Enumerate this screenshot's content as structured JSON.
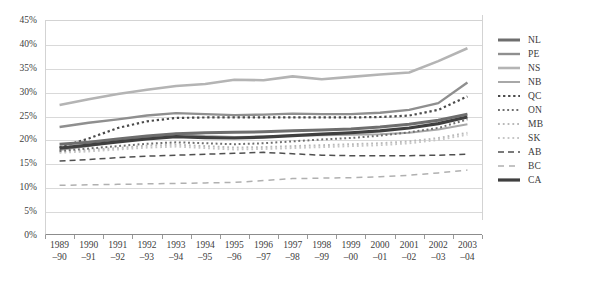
{
  "chart_data": {
    "type": "line",
    "title": "",
    "xlabel": "",
    "ylabel": "",
    "ylim": [
      0,
      45
    ],
    "ytick_step": 5,
    "grid": true,
    "legend_position": "right",
    "ytick_labels": [
      "45%",
      "40%",
      "35%",
      "30%",
      "25%",
      "20%",
      "15%",
      "10%",
      "5%",
      "0%"
    ],
    "ytick_values": [
      45,
      40,
      35,
      30,
      25,
      20,
      15,
      10,
      5,
      0
    ],
    "categories": [
      "1989–90",
      "1990–91",
      "1991–92",
      "1992–93",
      "1993–94",
      "1994–95",
      "1995–96",
      "1996–97",
      "1997–98",
      "1998–99",
      "1999–00",
      "2000–01",
      "2001–02",
      "2002–03",
      "2003–04"
    ],
    "category_lines": [
      [
        "1989",
        "–90"
      ],
      [
        "1990",
        "–91"
      ],
      [
        "1991",
        "–92"
      ],
      [
        "1992",
        "–93"
      ],
      [
        "1993",
        "–94"
      ],
      [
        "1994",
        "–95"
      ],
      [
        "1995",
        "–96"
      ],
      [
        "1996",
        "–97"
      ],
      [
        "1997",
        "–98"
      ],
      [
        "1998",
        "–99"
      ],
      [
        "1999",
        "–00"
      ],
      [
        "2000",
        "–01"
      ],
      [
        "2001",
        "–02"
      ],
      [
        "2002",
        "–03"
      ],
      [
        "2003",
        "–04"
      ]
    ],
    "series": [
      {
        "name": "NL",
        "style": "solid",
        "color": "#6e6e6e",
        "width": 3.0,
        "values": [
          19.0,
          19.4,
          20.1,
          20.7,
          21.2,
          21.4,
          21.5,
          21.6,
          21.8,
          22.0,
          22.2,
          22.6,
          23.2,
          24.0,
          25.3
        ]
      },
      {
        "name": "PE",
        "style": "solid",
        "color": "#8f8f8f",
        "width": 2.4,
        "values": [
          22.6,
          23.5,
          24.2,
          25.0,
          25.5,
          25.3,
          25.1,
          25.2,
          25.4,
          25.3,
          25.3,
          25.6,
          26.2,
          27.6,
          31.9
        ]
      },
      {
        "name": "NS",
        "style": "solid",
        "color": "#b4b4b4",
        "width": 2.6,
        "values": [
          27.2,
          28.4,
          29.5,
          30.4,
          31.2,
          31.6,
          32.5,
          32.4,
          33.2,
          32.6,
          33.1,
          33.6,
          34.0,
          36.4,
          39.1
        ]
      },
      {
        "name": "NB",
        "style": "solid",
        "color": "#a8a8a8",
        "width": 2.0,
        "values": [
          17.8,
          18.6,
          19.6,
          20.4,
          21.2,
          20.7,
          20.5,
          20.6,
          20.8,
          20.9,
          21.0,
          21.1,
          21.4,
          22.1,
          23.2
        ]
      },
      {
        "name": "QC",
        "style": "dotted-heavy",
        "color": "#4a4a4a",
        "width": 2.2,
        "values": [
          18.3,
          20.2,
          22.4,
          23.8,
          24.5,
          24.6,
          24.6,
          24.6,
          24.6,
          24.6,
          24.6,
          24.7,
          25.0,
          26.2,
          29.0
        ]
      },
      {
        "name": "ON",
        "style": "dotted-med",
        "color": "#6e6e6e",
        "width": 2.0,
        "values": [
          17.6,
          18.1,
          18.6,
          19.1,
          19.4,
          19.2,
          19.0,
          19.2,
          19.6,
          20.0,
          20.3,
          20.8,
          21.5,
          22.4,
          24.2
        ]
      },
      {
        "name": "MB",
        "style": "dotted-light",
        "color": "#b9b9b9",
        "width": 2.0,
        "values": [
          17.4,
          17.8,
          18.2,
          18.7,
          18.9,
          18.6,
          18.3,
          18.4,
          18.6,
          18.8,
          19.0,
          19.2,
          19.6,
          20.3,
          21.4
        ]
      },
      {
        "name": "SK",
        "style": "dotted-light",
        "color": "#c6c6c6",
        "width": 2.0,
        "values": [
          17.2,
          17.5,
          17.9,
          18.3,
          18.5,
          18.2,
          17.9,
          18.0,
          18.2,
          18.4,
          18.6,
          18.8,
          19.2,
          19.9,
          21.0
        ]
      },
      {
        "name": "AB",
        "style": "dashed-dark",
        "color": "#4f4f4f",
        "width": 1.5,
        "values": [
          15.5,
          15.8,
          16.2,
          16.5,
          16.7,
          16.9,
          17.1,
          17.3,
          17.0,
          16.7,
          16.6,
          16.6,
          16.6,
          16.7,
          16.9
        ]
      },
      {
        "name": "BC",
        "style": "dashed-light",
        "color": "#b0b0b0",
        "width": 1.5,
        "values": [
          10.4,
          10.5,
          10.6,
          10.7,
          10.8,
          10.9,
          11.0,
          11.4,
          11.8,
          11.9,
          12.0,
          12.2,
          12.5,
          13.0,
          13.6
        ]
      },
      {
        "name": "CA",
        "style": "solid",
        "color": "#3f3f3f",
        "width": 3.2,
        "values": [
          18.2,
          18.8,
          19.5,
          20.1,
          20.6,
          20.4,
          20.3,
          20.5,
          20.8,
          21.1,
          21.4,
          21.8,
          22.4,
          23.3,
          24.7
        ]
      }
    ]
  },
  "legend": {
    "items": [
      {
        "label": "NL"
      },
      {
        "label": "PE"
      },
      {
        "label": "NS"
      },
      {
        "label": "NB"
      },
      {
        "label": "QC"
      },
      {
        "label": "ON"
      },
      {
        "label": "MB"
      },
      {
        "label": "SK"
      },
      {
        "label": "AB"
      },
      {
        "label": "BC"
      },
      {
        "label": "CA"
      }
    ]
  }
}
